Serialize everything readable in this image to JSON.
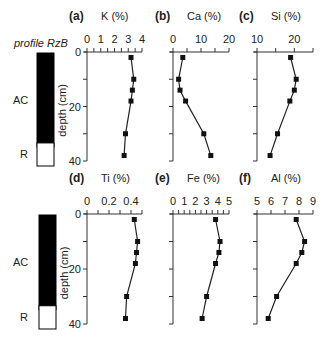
{
  "profile_label": "profile RzB",
  "horizons": [
    {
      "name": "AC",
      "top": 0,
      "bottom": 33,
      "fill": "#000000"
    },
    {
      "name": "R",
      "top": 33,
      "bottom": 40,
      "fill": "#ffffff"
    }
  ],
  "depth_axis": {
    "label": "depth (cm)",
    "ticks": [
      0,
      20,
      40
    ],
    "ylim": [
      0,
      40
    ]
  },
  "colors": {
    "line": "#222222",
    "marker": "#111111",
    "axis": "#333333"
  },
  "chart_data": [
    {
      "type": "line",
      "panel": "(a)",
      "title": "K (%)",
      "xlabel": "K (%)",
      "ylabel": "depth (cm)",
      "xlim": [
        0,
        4
      ],
      "xticks": [
        0,
        1,
        2,
        3,
        4
      ],
      "minor_step": 0.5,
      "ylim": [
        0,
        40
      ],
      "y_inverted": true,
      "depth": [
        2,
        10,
        14,
        18,
        30,
        38
      ],
      "values": [
        3.2,
        3.4,
        3.3,
        3.2,
        2.8,
        2.7
      ]
    },
    {
      "type": "line",
      "panel": "(b)",
      "title": "Ca (%)",
      "xlabel": "Ca (%)",
      "ylabel": "depth (cm)",
      "xlim": [
        0,
        20
      ],
      "xticks": [
        0,
        10,
        20
      ],
      "minor_step": 5,
      "ylim": [
        0,
        40
      ],
      "y_inverted": true,
      "depth": [
        2,
        10,
        14,
        18,
        30,
        38
      ],
      "values": [
        3.5,
        2.0,
        2.5,
        4.5,
        11.0,
        13.5
      ]
    },
    {
      "type": "line",
      "panel": "(c)",
      "title": "Si (%)",
      "xlabel": "Si (%)",
      "ylabel": "depth (cm)",
      "xlim": [
        10,
        25
      ],
      "xticks": [
        10,
        20
      ],
      "minor_step": 5,
      "ylim": [
        0,
        40
      ],
      "y_inverted": true,
      "depth": [
        2,
        10,
        14,
        18,
        30,
        38
      ],
      "values": [
        19.0,
        20.5,
        20.0,
        18.8,
        15.5,
        13.5
      ]
    },
    {
      "type": "line",
      "panel": "(d)",
      "title": "Ti (%)",
      "xlabel": "Ti (%)",
      "ylabel": "depth (cm)",
      "xlim": [
        0,
        0.5
      ],
      "xticks": [
        0,
        0.2,
        0.4
      ],
      "minor_step": 0.1,
      "ylim": [
        0,
        40
      ],
      "y_inverted": true,
      "depth": [
        2,
        10,
        14,
        18,
        30,
        38
      ],
      "values": [
        0.43,
        0.46,
        0.45,
        0.44,
        0.36,
        0.35
      ]
    },
    {
      "type": "line",
      "panel": "(e)",
      "title": "Fe (%)",
      "xlabel": "Fe (%)",
      "ylabel": "depth (cm)",
      "xlim": [
        0,
        5
      ],
      "xticks": [
        0,
        1,
        2,
        3,
        4,
        5
      ],
      "minor_step": 0.5,
      "ylim": [
        0,
        40
      ],
      "y_inverted": true,
      "depth": [
        2,
        10,
        14,
        18,
        30,
        38
      ],
      "values": [
        3.8,
        4.2,
        4.1,
        3.8,
        3.0,
        2.6
      ]
    },
    {
      "type": "line",
      "panel": "(f)",
      "title": "Al (%)",
      "xlabel": "Al (%)",
      "ylabel": "depth (cm)",
      "xlim": [
        5,
        9
      ],
      "xticks": [
        5,
        6,
        7,
        8,
        9
      ],
      "minor_step": 1,
      "ylim": [
        0,
        40
      ],
      "y_inverted": true,
      "depth": [
        2,
        10,
        14,
        18,
        30,
        38
      ],
      "values": [
        7.8,
        8.4,
        8.2,
        7.8,
        6.4,
        5.8
      ]
    }
  ]
}
